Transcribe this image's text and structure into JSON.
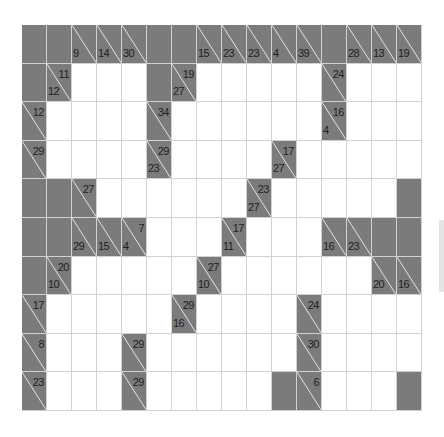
{
  "puzzle": {
    "type": "kakuro",
    "rows": 10,
    "cols": 16,
    "colors": {
      "block": "#7b7b7b",
      "white": "#ffffff",
      "grid_line": "#d2d2d2",
      "clue_text": "#1e1e1e",
      "diagonal": "#e8e8e8"
    },
    "grid": [
      [
        "B",
        "B",
        {
          "d": 9
        },
        {
          "d": 14
        },
        {
          "d": 30
        },
        "B",
        "B",
        {
          "d": 15
        },
        {
          "d": 23
        },
        {
          "d": 23
        },
        {
          "d": 4
        },
        {
          "d": 39
        },
        "B",
        {
          "d": 28
        },
        {
          "d": 13
        },
        {
          "d": 19
        }
      ],
      [
        "B",
        {
          "d": 12,
          "a": 11
        },
        "W",
        "W",
        "W",
        "B",
        {
          "d": 27,
          "a": 19
        },
        "W",
        "W",
        "W",
        "W",
        "W",
        {
          "a": 24
        },
        "W",
        "W",
        "W"
      ],
      [
        {
          "a": 12
        },
        "W",
        "W",
        "W",
        "W",
        {
          "a": 34
        },
        "W",
        "W",
        "W",
        "W",
        "W",
        "W",
        {
          "d": 4,
          "a": 16
        },
        "W",
        "W",
        "W"
      ],
      [
        {
          "a": 29
        },
        "W",
        "W",
        "W",
        "W",
        {
          "d": 23,
          "a": 29
        },
        "W",
        "W",
        "W",
        "W",
        {
          "d": 27,
          "a": 17
        },
        "W",
        "W",
        "W",
        "W",
        "W"
      ],
      [
        "B",
        "B",
        {
          "a": 27
        },
        "W",
        "W",
        "W",
        "W",
        "W",
        "W",
        {
          "d": 27,
          "a": 23
        },
        "W",
        "W",
        "W",
        "W",
        "W",
        "B"
      ],
      [
        "B",
        "B",
        {
          "d": 29
        },
        {
          "d": 15
        },
        {
          "d": 4,
          "a": 7
        },
        "W",
        "W",
        "W",
        {
          "d": 11,
          "a": 17
        },
        "W",
        "W",
        "W",
        {
          "d": 16
        },
        {
          "d": 23
        },
        "B",
        "B"
      ],
      [
        "B",
        {
          "d": 10,
          "a": 20
        },
        "W",
        "W",
        "W",
        "W",
        "W",
        {
          "d": 10,
          "a": 27
        },
        "W",
        "W",
        "W",
        "W",
        "W",
        "W",
        {
          "d": 20
        },
        {
          "d": 16
        }
      ],
      [
        {
          "a": 17
        },
        "W",
        "W",
        "W",
        "W",
        "W",
        {
          "d": 16,
          "a": 29
        },
        "W",
        "W",
        "W",
        "W",
        {
          "a": 24
        },
        "W",
        "W",
        "W",
        "W"
      ],
      [
        {
          "a": 8
        },
        "W",
        "W",
        "W",
        {
          "a": 29
        },
        "W",
        "W",
        "W",
        "W",
        "W",
        "W",
        {
          "a": 30
        },
        "W",
        "W",
        "W",
        "W"
      ],
      [
        {
          "a": 23
        },
        "W",
        "W",
        "W",
        {
          "a": 29
        },
        "W",
        "W",
        "W",
        "W",
        "W",
        "B",
        {
          "a": 6
        },
        "W",
        "W",
        "W",
        "B"
      ]
    ]
  },
  "scrollbar": {
    "visible": true
  }
}
